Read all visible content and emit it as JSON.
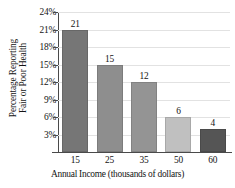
{
  "chart_data": {
    "type": "bar",
    "title": "",
    "xlabel": "Annual Income (thousands of dollars)",
    "ylabel": "Percentage Reporting Fair or Poor Health",
    "ylabel_line1": "Percentage Reporting",
    "ylabel_line2": "Fair or Poor Health",
    "categories": [
      "15",
      "25",
      "35",
      "50",
      "60"
    ],
    "values": [
      21,
      15,
      12,
      6,
      4
    ],
    "value_labels": [
      "21",
      "15",
      "12",
      "6",
      "4"
    ],
    "bar_colors": [
      "#767676",
      "#8e8e8e",
      "#949494",
      "#c0c0c0",
      "#555555"
    ],
    "ylim": [
      0,
      24
    ],
    "ytick_values": [
      24,
      21,
      18,
      15,
      12,
      9,
      6,
      3
    ],
    "ytick_labels": [
      "24%",
      "21%",
      "18%",
      "15%",
      "12%",
      "9%",
      "6%",
      "3%"
    ],
    "grid": true,
    "grid_color": "#e2e2e2",
    "axis_color": "#4a4a4a",
    "legend": "none",
    "legend_position": "none"
  }
}
